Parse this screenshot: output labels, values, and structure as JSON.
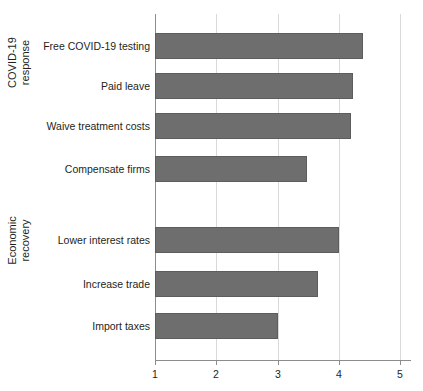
{
  "chart_data": {
    "type": "bar",
    "orientation": "horizontal",
    "title": "",
    "xlabel": "",
    "ylabel": "",
    "xlim": [
      1,
      5
    ],
    "grid": true,
    "legend": null,
    "xticks": [
      "1",
      "2",
      "3",
      "4",
      "5"
    ],
    "xtick_values": [
      1,
      2,
      3,
      4,
      5
    ],
    "bar_color": "#6e6e6e",
    "axis_color": "#8d8d8d",
    "grid_color": "#d9d9d9",
    "text_color": "#231f20",
    "groups": [
      {
        "label": "COVID-19\nresponse",
        "categories": [
          "Free COVID-19 testing",
          "Paid leave",
          "Waive treatment costs",
          "Compensate firms"
        ],
        "values": [
          4.4,
          4.23,
          4.2,
          3.48
        ]
      },
      {
        "label": "Economic\nrecovery",
        "categories": [
          "Lower interest rates",
          "Increase trade",
          "Import taxes"
        ],
        "values": [
          4.0,
          3.66,
          3.01
        ]
      }
    ],
    "categories": [
      "Free COVID-19 testing",
      "Paid leave",
      "Waive treatment costs",
      "Compensate firms",
      "Lower interest rates",
      "Increase trade",
      "Import taxes"
    ],
    "values": [
      4.4,
      4.23,
      4.2,
      3.48,
      4.0,
      3.66,
      3.01
    ]
  }
}
